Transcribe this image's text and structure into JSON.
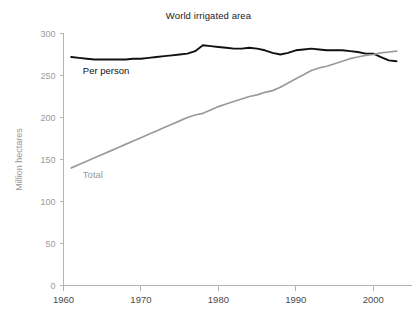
{
  "chart_data": {
    "type": "line",
    "title": "World irrigated area",
    "xlabel": "",
    "ylabel": "Million hectares",
    "xlim": [
      1960,
      2005
    ],
    "ylim": [
      0,
      300
    ],
    "xticks": [
      "1960",
      "1970",
      "1980",
      "1990",
      "2000"
    ],
    "xtick_values": [
      1960,
      1970,
      1980,
      1990,
      2000
    ],
    "yticks": [
      "0",
      "50",
      "100",
      "150",
      "200",
      "250",
      "300"
    ],
    "ytick_values": [
      0,
      50,
      100,
      150,
      200,
      250,
      300
    ],
    "grid": false,
    "legend": "inline-labels",
    "annotations": [
      {
        "text": "Per person",
        "x": 1962.5,
        "y": 252,
        "color": "#111111"
      },
      {
        "text": "Total",
        "x": 1962.5,
        "y": 128,
        "color": "#9a9a9a"
      }
    ],
    "series": [
      {
        "name": "Per person",
        "color": "#111111",
        "label": "Per person",
        "x": [
          1961,
          1962,
          1963,
          1964,
          1965,
          1966,
          1967,
          1968,
          1969,
          1970,
          1971,
          1972,
          1973,
          1974,
          1975,
          1976,
          1977,
          1978,
          1979,
          1980,
          1981,
          1982,
          1983,
          1984,
          1985,
          1986,
          1987,
          1988,
          1989,
          1990,
          1991,
          1992,
          1993,
          1994,
          1995,
          1996,
          1997,
          1998,
          1999,
          2000,
          2001,
          2002,
          2003
        ],
        "values": [
          272,
          271,
          270,
          269,
          269,
          269,
          269,
          269,
          270,
          270,
          271,
          272,
          273,
          274,
          275,
          276,
          279,
          286,
          285,
          284,
          283,
          282,
          282,
          283,
          282,
          280,
          277,
          275,
          277,
          280,
          281,
          282,
          281,
          280,
          280,
          280,
          279,
          278,
          276,
          276,
          272,
          268,
          267
        ]
      },
      {
        "name": "Total",
        "color": "#9a9a9a",
        "label": "Total",
        "x": [
          1961,
          1962,
          1963,
          1964,
          1965,
          1966,
          1967,
          1968,
          1969,
          1970,
          1971,
          1972,
          1973,
          1974,
          1975,
          1976,
          1977,
          1978,
          1979,
          1980,
          1981,
          1982,
          1983,
          1984,
          1985,
          1986,
          1987,
          1988,
          1989,
          1990,
          1991,
          1992,
          1993,
          1994,
          1995,
          1996,
          1997,
          1998,
          1999,
          2000,
          2001,
          2002,
          2003
        ],
        "values": [
          140,
          144,
          148,
          152,
          156,
          160,
          164,
          168,
          172,
          176,
          180,
          184,
          188,
          192,
          196,
          200,
          203,
          205,
          209,
          213,
          216,
          219,
          222,
          225,
          227,
          230,
          232,
          236,
          241,
          246,
          251,
          256,
          259,
          261,
          264,
          267,
          270,
          272,
          274,
          275,
          277,
          278,
          279
        ]
      }
    ]
  }
}
